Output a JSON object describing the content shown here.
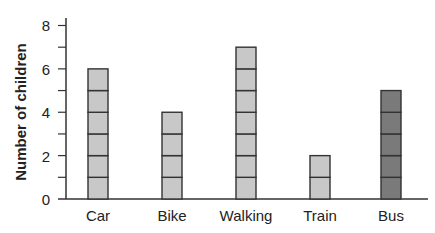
{
  "chart_data": {
    "type": "bar",
    "style": "pictogram-stacked-units",
    "xlabel": "",
    "ylabel": "Number of children",
    "categories": [
      "Car",
      "Bike",
      "Walking",
      "Train",
      "Bus"
    ],
    "values": [
      6,
      4,
      7,
      2,
      5
    ],
    "ylim": [
      0,
      8
    ],
    "yticks": [
      0,
      2,
      4,
      6,
      8
    ],
    "minor_yticks": [
      1,
      3,
      5,
      7
    ],
    "grid": false,
    "legend": null,
    "unit_per_block": 1,
    "colors": {
      "Car": "#c8c8c8",
      "Bike": "#c8c8c8",
      "Walking": "#c8c8c8",
      "Train": "#c8c8c8",
      "Bus": "#7a7a7a"
    }
  },
  "labels": {
    "ylabel": "Number of children",
    "yticks": [
      "0",
      "2",
      "4",
      "6",
      "8"
    ],
    "xticks": [
      "Car",
      "Bike",
      "Walking",
      "Train",
      "Bus"
    ]
  },
  "style": {
    "axis_color": "#333333",
    "block_border": "#333333",
    "light_fill": "#c8c8c8",
    "dark_fill": "#7a7a7a"
  }
}
